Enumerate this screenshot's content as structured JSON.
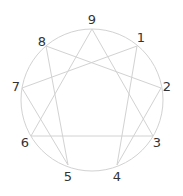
{
  "diagram": {
    "type": "enneagram",
    "circle": {
      "cx": 92,
      "cy": 100,
      "r": 71
    },
    "line_color": "#d2d2d2",
    "label_color": "#333333",
    "points": [
      {
        "id": "9",
        "x": 92,
        "y": 29,
        "lx": 92,
        "ly": 19
      },
      {
        "id": "1",
        "x": 137,
        "y": 46,
        "lx": 141,
        "ly": 37
      },
      {
        "id": "2",
        "x": 161,
        "y": 88,
        "lx": 167,
        "ly": 86
      },
      {
        "id": "3",
        "x": 153,
        "y": 136,
        "lx": 157,
        "ly": 142
      },
      {
        "id": "4",
        "x": 117,
        "y": 165,
        "lx": 117,
        "ly": 176
      },
      {
        "id": "5",
        "x": 68,
        "y": 165,
        "lx": 68,
        "ly": 176
      },
      {
        "id": "6",
        "x": 31,
        "y": 136,
        "lx": 25,
        "ly": 142
      },
      {
        "id": "7",
        "x": 22,
        "y": 88,
        "lx": 16,
        "ly": 86
      },
      {
        "id": "8",
        "x": 46,
        "y": 46,
        "lx": 42,
        "ly": 41
      }
    ],
    "connections": [
      [
        "1",
        "4"
      ],
      [
        "4",
        "2"
      ],
      [
        "2",
        "8"
      ],
      [
        "8",
        "5"
      ],
      [
        "5",
        "7"
      ],
      [
        "7",
        "1"
      ],
      [
        "9",
        "3"
      ],
      [
        "3",
        "6"
      ],
      [
        "6",
        "9"
      ]
    ]
  },
  "labels": {
    "p9": "9",
    "p1": "1",
    "p2": "2",
    "p3": "3",
    "p4": "4",
    "p5": "5",
    "p6": "6",
    "p7": "7",
    "p8": "8"
  }
}
